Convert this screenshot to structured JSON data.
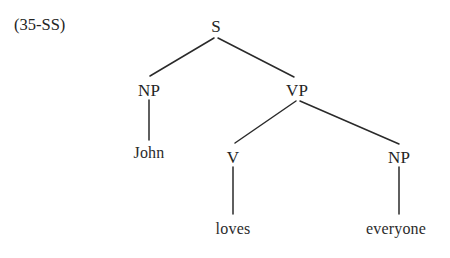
{
  "figure": {
    "example_number": "(35-SS)",
    "caption": "",
    "background_color": "#ffffff",
    "line_color": "#2a2a2a",
    "text_color": "#242424"
  },
  "tree": {
    "type": "constituency-tree",
    "sentence": "John loves everyone",
    "nodes": {
      "root": {
        "label": "S",
        "x": 216,
        "y": 26
      },
      "subject_np": {
        "label": "NP",
        "x": 149,
        "y": 90
      },
      "vp": {
        "label": "VP",
        "x": 297,
        "y": 90
      },
      "john": {
        "label": "John",
        "x": 149,
        "y": 153
      },
      "v": {
        "label": "V",
        "x": 233,
        "y": 157
      },
      "object_np": {
        "label": "NP",
        "x": 399,
        "y": 157
      },
      "loves": {
        "label": "loves",
        "x": 233,
        "y": 229
      },
      "everyone": {
        "label": "everyone",
        "x": 396,
        "y": 229
      }
    },
    "edges": [
      {
        "from": "root",
        "to": "subject_np",
        "x1": 214,
        "y1": 38,
        "x2": 150,
        "y2": 76
      },
      {
        "from": "root",
        "to": "vp",
        "x1": 218,
        "y1": 38,
        "x2": 294,
        "y2": 77
      },
      {
        "from": "subject_np",
        "to": "john",
        "x1": 149,
        "y1": 100,
        "x2": 149,
        "y2": 140
      },
      {
        "from": "vp",
        "to": "v",
        "x1": 296,
        "y1": 101,
        "x2": 235,
        "y2": 143
      },
      {
        "from": "vp",
        "to": "object_np",
        "x1": 300,
        "y1": 101,
        "x2": 399,
        "y2": 144
      },
      {
        "from": "v",
        "to": "loves",
        "x1": 233,
        "y1": 167,
        "x2": 233,
        "y2": 214
      },
      {
        "from": "object_np",
        "to": "everyone",
        "x1": 399,
        "y1": 167,
        "x2": 399,
        "y2": 214
      }
    ]
  }
}
